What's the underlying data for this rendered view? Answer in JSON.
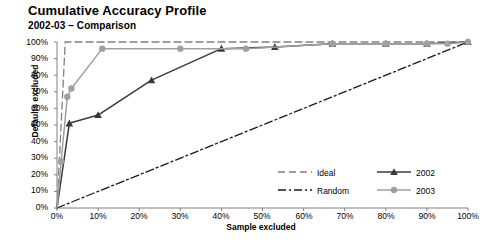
{
  "title": "Cumulative Accuracy Profile",
  "subtitle": "2002-03 – Comparison",
  "axis": {
    "xlabel": "Sample excluded",
    "ylabel": "Defaults excluded",
    "xticks": [
      "0%",
      "10%",
      "20%",
      "30%",
      "40%",
      "50%",
      "60%",
      "70%",
      "80%",
      "90%",
      "100%"
    ],
    "yticks": [
      "0%",
      "10%",
      "20%",
      "30%",
      "40%",
      "50%",
      "60%",
      "70%",
      "80%",
      "90%",
      "100%"
    ]
  },
  "legend": {
    "ideal": "Ideal",
    "random": "Random",
    "y2002": "2002",
    "y2003": "2003"
  },
  "colors": {
    "series_2002": "#3a3a3a",
    "series_2003": "#a0a0a0",
    "ideal": "#808080",
    "random": "#1a1a1a",
    "axis": "#808080"
  },
  "chart_data": {
    "type": "line",
    "title": "Cumulative Accuracy Profile",
    "subtitle": "2002-03 – Comparison",
    "xlabel": "Sample excluded",
    "ylabel": "Defaults excluded",
    "xlim": [
      0,
      100
    ],
    "ylim": [
      0,
      100
    ],
    "grid": false,
    "legend_position": "bottom-right",
    "units": "percent",
    "series": [
      {
        "name": "Ideal",
        "style": "dashed",
        "marker": "none",
        "color": "#808080",
        "x": [
          0,
          2,
          100
        ],
        "y": [
          0,
          100,
          100
        ]
      },
      {
        "name": "Random",
        "style": "dash-dot",
        "marker": "none",
        "color": "#1a1a1a",
        "x": [
          0,
          100
        ],
        "y": [
          0,
          100
        ]
      },
      {
        "name": "2002",
        "style": "solid",
        "marker": "triangle",
        "color": "#3a3a3a",
        "x": [
          0,
          3,
          10,
          23,
          40,
          53,
          67,
          80,
          90,
          100
        ],
        "y": [
          0,
          51,
          56,
          77,
          96,
          97,
          99,
          99,
          99,
          100
        ]
      },
      {
        "name": "2003",
        "style": "solid",
        "marker": "circle",
        "color": "#a0a0a0",
        "x": [
          0,
          1,
          2.5,
          3.5,
          11,
          30,
          46,
          67,
          80,
          90,
          95,
          100
        ],
        "y": [
          0,
          28,
          67,
          72,
          96,
          96,
          96,
          99,
          99,
          99,
          99,
          100
        ]
      }
    ]
  }
}
